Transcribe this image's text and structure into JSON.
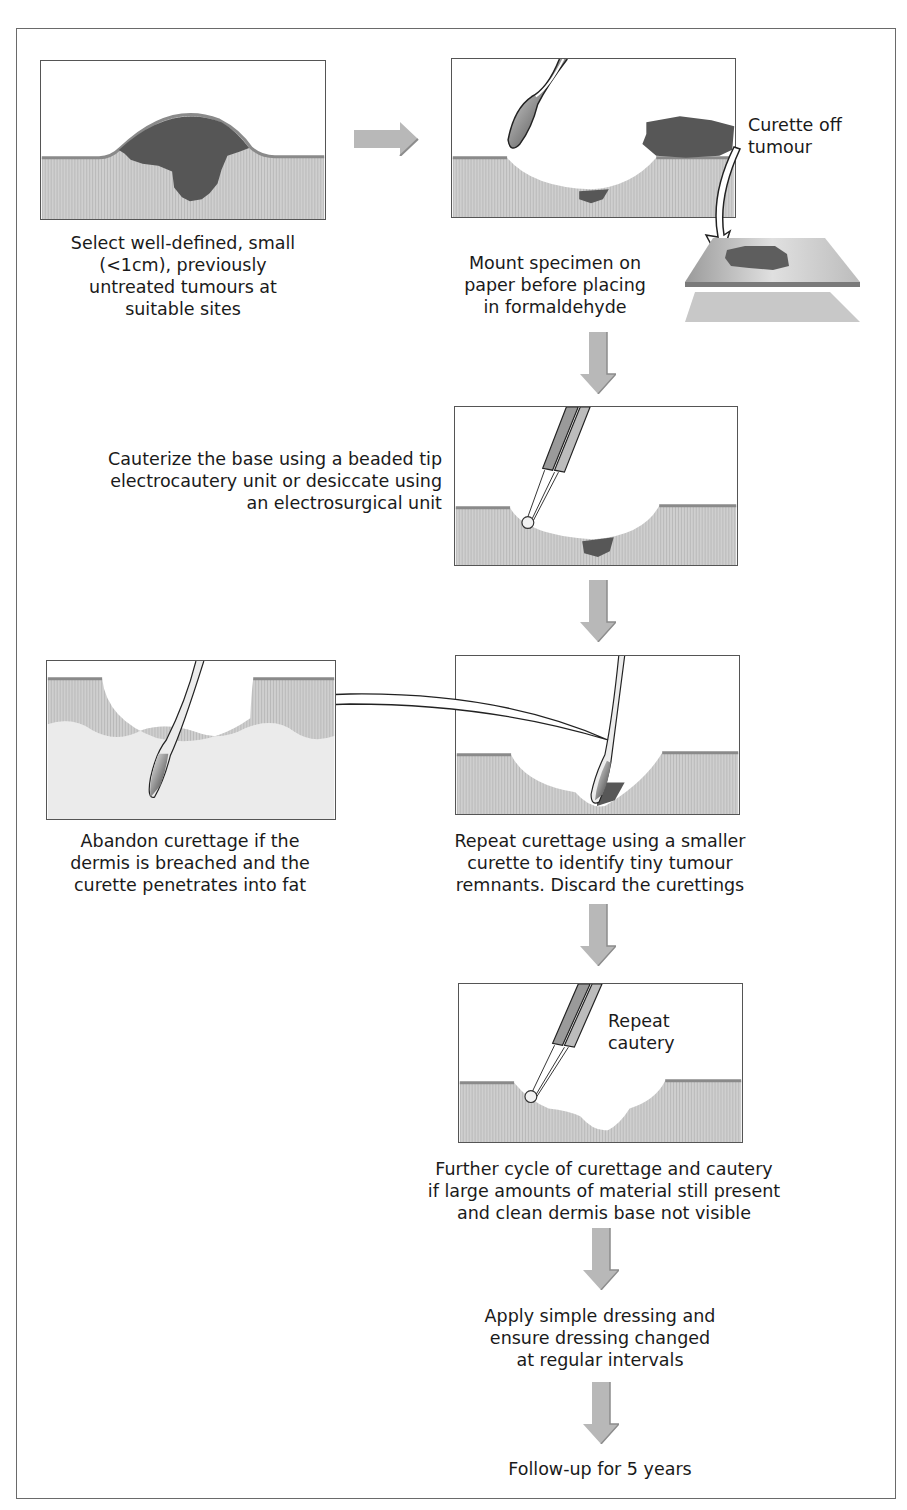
{
  "diagram": {
    "type": "flowchart",
    "colors": {
      "frame": "#6a6a6a",
      "skin": "#c9c9c9",
      "skin_surface": "#8f8f8f",
      "tumour": "#575757",
      "arrow": "#b4b4b4",
      "text": "#1a1a1a"
    },
    "steps": [
      {
        "id": "select",
        "caption": "Select well-defined, small\n(<1cm), previously\nuntreated tumours at\nsuitable sites",
        "illustration": "raised-tumour-on-skin"
      },
      {
        "id": "curette",
        "label": "Curette off\ntumour",
        "caption": "Mount specimen on\npaper before placing\nin formaldehyde",
        "illustration": "curette-removing-tumour-with-specimen-on-paper"
      },
      {
        "id": "cauterize",
        "caption": "Cauterize the base using a beaded tip\nelectrocautery unit or desiccate using\nan electrosurgical unit",
        "illustration": "beaded-tip-electrocautery"
      },
      {
        "id": "repeat-curettage",
        "caption": "Repeat curettage using a smaller\ncurette to identify tiny tumour\nremnants. Discard the curettings",
        "illustration": "small-curette-in-wound"
      },
      {
        "id": "abandon",
        "caption": "Abandon curettage if the\ndermis is breached and the\ncurette penetrates into fat",
        "illustration": "curette-penetrating-into-fat"
      },
      {
        "id": "repeat-cautery",
        "label": "Repeat\ncautery",
        "caption": "Further cycle of curettage and cautery\nif large amounts of material still present\nand clean dermis base not visible",
        "illustration": "repeat-cautery"
      },
      {
        "id": "dressing",
        "caption": "Apply simple dressing and\nensure dressing changed\nat regular intervals"
      },
      {
        "id": "followup",
        "caption": "Follow-up for 5 years"
      }
    ],
    "connections": [
      {
        "from": "select",
        "to": "curette",
        "style": "block-arrow-right"
      },
      {
        "from": "curette",
        "to": "cauterize",
        "style": "block-arrow-down"
      },
      {
        "from": "cauterize",
        "to": "repeat-curettage",
        "style": "block-arrow-down"
      },
      {
        "from": "repeat-curettage",
        "to": "abandon",
        "style": "curved-outline-arrow"
      },
      {
        "from": "repeat-curettage",
        "to": "repeat-cautery",
        "style": "block-arrow-down"
      },
      {
        "from": "repeat-cautery",
        "to": "dressing",
        "style": "block-arrow-down"
      },
      {
        "from": "dressing",
        "to": "followup",
        "style": "block-arrow-down"
      }
    ]
  }
}
